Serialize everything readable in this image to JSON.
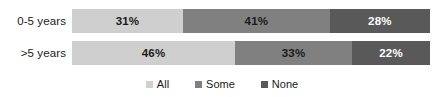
{
  "chart_data": {
    "type": "bar",
    "orientation": "horizontal",
    "stacked": true,
    "stack_mode": "percent",
    "title": "",
    "subtitle": "",
    "xlabel": "",
    "ylabel": "",
    "xlim": [
      0,
      100
    ],
    "grid": false,
    "legend_position": "bottom",
    "categories": [
      "0-5 years",
      ">5 years"
    ],
    "series": [
      {
        "name": "All",
        "color": "#cfcfcf",
        "values": [
          31,
          46
        ],
        "labels": [
          "31%",
          "46%"
        ]
      },
      {
        "name": "Some",
        "color": "#808080",
        "values": [
          41,
          33
        ],
        "labels": [
          "41%",
          "33%"
        ]
      },
      {
        "name": "None",
        "color": "#595959",
        "values": [
          28,
          22
        ],
        "labels": [
          "28%",
          "22%"
        ]
      }
    ],
    "legend": [
      {
        "label": "All",
        "color": "#cfcfcf"
      },
      {
        "label": "Some",
        "color": "#808080"
      },
      {
        "label": "None",
        "color": "#595959"
      }
    ]
  }
}
